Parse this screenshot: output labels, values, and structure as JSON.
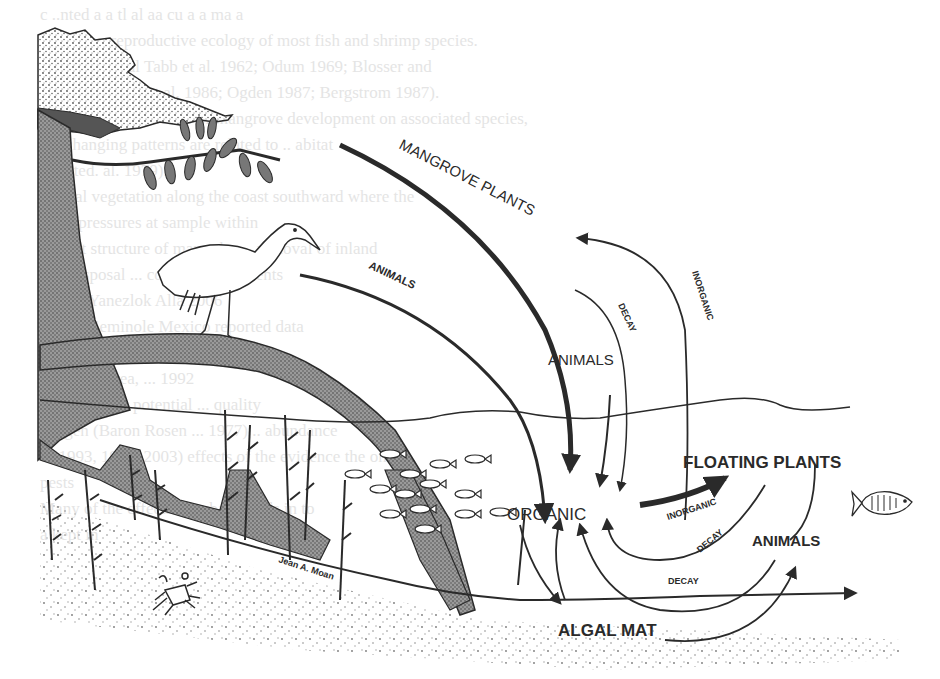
{
  "diagram": {
    "nodes": {
      "mangrove_plants": "MANGROVE PLANTS",
      "animals_upper_left": "ANIMALS",
      "animals_center": "ANIMALS",
      "organic": "ORGANIC",
      "floating_plants": "FLOATING PLANTS",
      "animals_right": "ANIMALS",
      "algal_mat": "ALGAL MAT"
    },
    "edge_labels": {
      "decay_upper": "DECAY",
      "inorganic_upper": "INORGANIC",
      "inorganic_lower": "INORGANIC",
      "decay_right": "DECAY",
      "decay_bottom": "DECAY"
    },
    "signature": "Jean A. Moan",
    "illustrations": [
      "mangrove-tree",
      "heron",
      "fish-school",
      "fish",
      "crab",
      "seagrass",
      "water-surface",
      "sediment"
    ],
    "colors": {
      "ink": "#2a2a2a",
      "background": "#ffffff",
      "bleed_text": "#cfcfcf"
    }
  },
  "bleed_through_text": [
    "c     ..nted a a    tl       al  aa         cu  a   a ma  a",
    "effects on reproductive ecology of most fish  and shrimp          species.",
    "   flow to coastal      Tabb et al. 1962; Odum 1969; Blosser and",
    "    1979; Browder et al. 1986; Ogden 1987; Bergstrom 1987).",
    "With respect to effects of mangrove development on associated species,",
    "    the changing patterns are related to       ..  abitat",
    "   affected.     al. 1979).",
    "     coastal vegetation along the coast southward where        the",
    "   Lovs    pressures at   sample               within",
    "  habitat structure of many     the ...  removal of        inland",
    "   fish disposal    ... computer          sediments",
    "     during            Yanezlok   Alla           2006",
    "  area to Seminole       Mexico       reported       data",
    "  structures of        unit          stream  of    damage",
    "     impacted area,       ...                        1992",
    "             magnitude   ... potential ...        quality",
    "  Bergen (Baron   Rosen ... 1977)    ..   abundance",
    "  of 1993, 1998, 2003) effects        of the evidence the      on",
    "      pests",
    "  Many of the effects of    urban      trends  in            to",
    "    a   kept  in          "
  ]
}
